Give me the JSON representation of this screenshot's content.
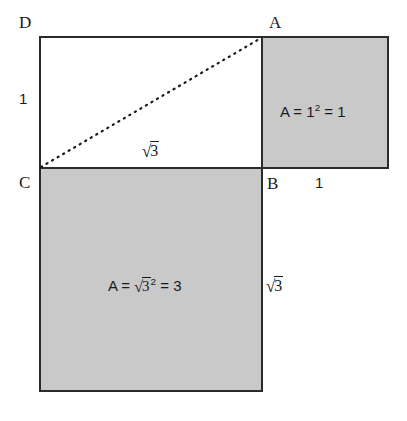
{
  "diagram": {
    "background_color": "#ffffff",
    "outline_color": "#2b2b2b",
    "fill_gray": "#c9c9c9",
    "vertices": [
      {
        "id": "D",
        "label": "D"
      },
      {
        "id": "A",
        "label": "A"
      },
      {
        "id": "C",
        "label": "C"
      },
      {
        "id": "B",
        "label": "B"
      }
    ],
    "dimensions": {
      "left_side": "1",
      "top_middle_radical_sign": "√",
      "top_middle_radicand": "3",
      "bottom_right_side": "1",
      "right_side_radical_sign": "√",
      "right_side_radicand": "3"
    },
    "areas": {
      "small_square": {
        "prefix": "A = 1",
        "exponent": "2",
        "suffix": " = 1"
      },
      "large_square": {
        "prefix": "A = ",
        "radical_sign": "√",
        "radicand": "3",
        "exponent": "2",
        "suffix": " = 3"
      }
    },
    "diagonal": {
      "style": "dashed",
      "from": "C",
      "to": "A"
    }
  }
}
